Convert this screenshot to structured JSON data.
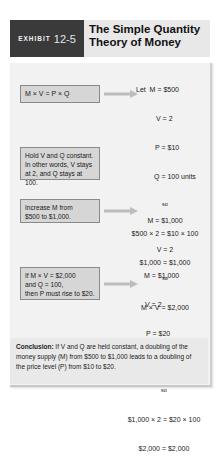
{
  "header": {
    "exhibit_label": "EXHIBIT",
    "exhibit_number": "12-5",
    "title_line1": "The Simple Quantity",
    "title_line2": "Theory of Money"
  },
  "steps": [
    {
      "box_text": [
        "M × V = P × Q"
      ],
      "equations": [
        "Let  M = $500",
        "V = 2",
        "P = $10",
        "Q = 100 units",
        "so",
        "$500 × 2 = $10 × 100",
        "$1,000 = $1,000"
      ]
    },
    {
      "box_text": [
        "Hold V and Q constant.",
        "In other words, V stays",
        "at 2, and Q stays at 100."
      ],
      "equations": []
    },
    {
      "box_text": [
        "Increase M from",
        "$500 to $1,000."
      ],
      "equations": [
        "M = $1,000",
        "V = 2",
        "so",
        "M × V = $2,000"
      ]
    },
    {
      "box_text": [
        "If M × V = $2,000",
        "and Q = 100,",
        "then P must rise to $20."
      ],
      "equations": [
        "M = $1,000",
        "V = 2",
        "P = $20",
        "Q = 100 units",
        "so",
        "$1,000 × 2 = $20 × 100",
        "$2,000 = $2,000"
      ]
    }
  ],
  "conclusion": {
    "label": "Conclusion:",
    "text": " If V and Q are held constant, a doubling of the money supply (M) from $500 to $1,000 leads to a doubling of the price level (P) from $10 to $20."
  },
  "colors": {
    "exhibit_bg": "#3a3a3a",
    "title_bg": "#e8e8e8",
    "panel_bg": "#f2f2f2",
    "box_bg": "#d6d6d6",
    "arrow": "#b8b8b8"
  }
}
